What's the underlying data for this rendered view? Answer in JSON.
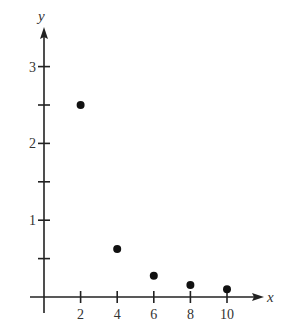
{
  "chart_data": {
    "type": "scatter",
    "title": "",
    "xlabel": "x",
    "ylabel": "y",
    "x": [
      2,
      4,
      6,
      8,
      10
    ],
    "y": [
      2.5,
      0.625,
      0.278,
      0.156,
      0.1
    ],
    "series": [
      {
        "name": "points",
        "x": [
          2,
          4,
          6,
          8,
          10
        ],
        "y": [
          2.5,
          0.625,
          0.278,
          0.156,
          0.1
        ]
      }
    ],
    "xticks": [
      2,
      4,
      6,
      8,
      10
    ],
    "xtick_labels": [
      "2",
      "4",
      "6",
      "8",
      "10"
    ],
    "yticks": [
      0.5,
      1,
      1.5,
      2,
      2.5,
      3
    ],
    "ytick_labels": [
      "",
      "1",
      "",
      "2",
      "",
      "3"
    ],
    "xlim": [
      0,
      12
    ],
    "ylim": [
      0,
      3.5
    ],
    "grid": false,
    "legend": null,
    "colors": {
      "axis": "#222222",
      "points": "#111111",
      "text": "#333333"
    }
  }
}
